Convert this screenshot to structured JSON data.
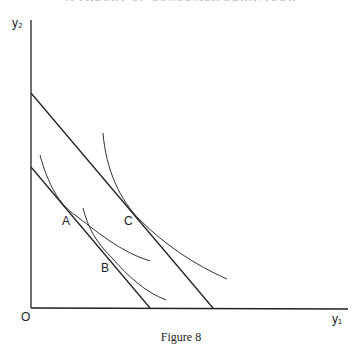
{
  "header": {
    "text": "A THEORY OF CONSUMER BEHAVIOUR"
  },
  "axes": {
    "y_label": "y₂",
    "x_label": "y₁",
    "origin_label": "O"
  },
  "points": [
    {
      "label": "A"
    },
    {
      "label": "B"
    },
    {
      "label": "C"
    }
  ],
  "caption": "Figure 8"
}
